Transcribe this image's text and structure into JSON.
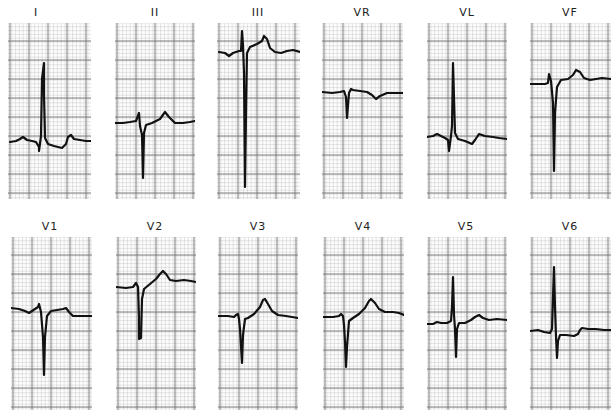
{
  "chart_data": {
    "type": "line",
    "layout": {
      "rows": 2,
      "cols": 6,
      "grid": true,
      "minor_grid_px": 3.8,
      "major_grid_px": 19
    },
    "colors": {
      "trace": "#111111",
      "major_grid": "#6f6f6f",
      "minor_grid": "#c9c9c9",
      "paper": "#fdfdfd"
    },
    "leads": [
      {
        "name": "I",
        "label_x": 36,
        "label_y": 6,
        "x": 8,
        "y": 23,
        "w": 83,
        "h": 176,
        "points": "2,119 8,118 12,116 15,114 19,117 24,118 28,119 31,124 31,128 33,113 34,56 36,40 36,72 37,115 40,121 46,123 54,125 58,121 60,114 63,112 66,116 72,117 78,118 83,118"
      },
      {
        "name": "II",
        "label_x": 155,
        "label_y": 6,
        "x": 115,
        "y": 23,
        "w": 80,
        "h": 176,
        "points": "0,100 8,100 15,99 21,98 24,90 25,103 27,112 28,155 29,110 31,102 37,100 45,96 50,89 54,94 60,100 68,100 75,99 80,98"
      },
      {
        "name": "III",
        "label_x": 258,
        "label_y": 6,
        "x": 217,
        "y": 23,
        "w": 83,
        "h": 176,
        "points": "2,29 8,30 12,33 16,30 22,28 24,28 25,8 26,22 27,50 28,164 29,90 30,30 33,24 40,21 45,18 47,13 50,16 53,25 58,29 64,30 70,28 76,27 83,29"
      },
      {
        "name": "VR",
        "label_x": 362,
        "label_y": 6,
        "x": 322,
        "y": 23,
        "w": 81,
        "h": 176,
        "points": "0,69 10,70 18,69 22,68 24,74 25,95 27,70 29,66 31,67 38,68 45,69 50,72 54,76 58,73 65,70 72,70 81,70"
      },
      {
        "name": "VL",
        "label_x": 467,
        "label_y": 6,
        "x": 427,
        "y": 23,
        "w": 80,
        "h": 176,
        "points": "0,114 6,113 10,111 14,113 18,115 21,117 22,128 24,113 25,103 26,40 27,75 28,110 31,116 38,118 45,121 48,117 52,111 58,113 66,114 72,115 80,116"
      },
      {
        "name": "VF",
        "label_x": 570,
        "label_y": 6,
        "x": 530,
        "y": 23,
        "w": 81,
        "h": 176,
        "points": "0,61 8,61 15,61 18,60 19,51 21,58 23,80 24,148 25,90 27,64 31,57 38,56 43,52 46,47 50,49 54,55 60,57 66,56 72,55 81,56"
      },
      {
        "name": "V1",
        "label_x": 50,
        "label_y": 220,
        "x": 11,
        "y": 237,
        "w": 81,
        "h": 173,
        "points": "0,71 8,72 14,74 18,76 24,72 27,70 28,67 30,75 32,100 33,138 34,100 36,79 40,74 46,73 52,72 55,71 58,75 62,79 70,79 81,79"
      },
      {
        "name": "V2",
        "label_x": 155,
        "label_y": 220,
        "x": 116,
        "y": 237,
        "w": 80,
        "h": 173,
        "points": "0,50 10,51 17,50 20,46 22,50 23,80 23,102 25,101 26,62 28,52 34,47 40,42 44,37 47,34 50,37 54,43 60,44 68,43 75,44 80,45"
      },
      {
        "name": "V3",
        "label_x": 258,
        "label_y": 220,
        "x": 218,
        "y": 237,
        "w": 80,
        "h": 173,
        "points": "0,79 10,79 16,80 18,78 20,77 21,82 22,92 24,126 25,98 27,82 30,81 36,77 42,70 45,63 47,62 50,67 54,74 60,78 68,79 74,80 80,81"
      },
      {
        "name": "V4",
        "label_x": 363,
        "label_y": 220,
        "x": 323,
        "y": 237,
        "w": 81,
        "h": 173,
        "points": "0,80 10,80 16,79 18,77 20,79 21,88 22,105 23,130 24,110 26,84 30,81 36,77 42,71 46,64 48,62 52,66 56,72 62,75 70,75 76,76 81,78"
      },
      {
        "name": "V5",
        "label_x": 466,
        "label_y": 220,
        "x": 427,
        "y": 237,
        "w": 80,
        "h": 173,
        "points": "0,87 6,87 10,85 14,86 20,86 24,84 25,70 26,40 27,78 28,92 29,120 30,92 32,86 38,86 44,83 48,80 52,78 56,81 62,83 70,82 80,83"
      },
      {
        "name": "V6",
        "label_x": 570,
        "label_y": 220,
        "x": 530,
        "y": 237,
        "w": 81,
        "h": 173,
        "points": "0,94 8,93 14,95 20,96 22,92 23,60 24,30 25,70 26,100 27,121 28,104 30,98 36,98 44,99 48,97 50,93 52,91 58,92 66,92 74,93 81,93"
      }
    ]
  }
}
